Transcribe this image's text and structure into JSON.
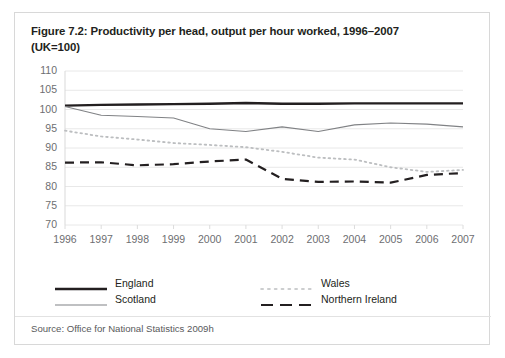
{
  "figure": {
    "title_line1": "Figure 7.2: Productivity per head, output per hour worked, 1996–2007",
    "title_line2": "(UK=100)",
    "source": "Source: Office for National Statistics 2009h"
  },
  "legend": {
    "items": [
      {
        "label": "England",
        "style": "thick-solid",
        "color": "#231f20"
      },
      {
        "label": "Scotland",
        "style": "thin-solid",
        "color": "#808285"
      },
      {
        "label": "Wales",
        "style": "dotted",
        "color": "#bcbec0"
      },
      {
        "label": "Northern Ireland",
        "style": "dashed",
        "color": "#231f20"
      }
    ]
  },
  "chart_data": {
    "type": "line",
    "title": "Figure 7.2: Productivity per head, output per hour worked, 1996–2007 (UK=100)",
    "xlabel": "",
    "ylabel": "",
    "categories": [
      "1996",
      "1997",
      "1998",
      "1999",
      "2000",
      "2001",
      "2002",
      "2003",
      "2004",
      "2005",
      "2006",
      "2007"
    ],
    "x": [
      1996,
      1997,
      1998,
      1999,
      2000,
      2001,
      2002,
      2003,
      2004,
      2005,
      2006,
      2007
    ],
    "ylim": [
      70,
      110
    ],
    "yticks": [
      70,
      75,
      80,
      85,
      90,
      95,
      100,
      105,
      110
    ],
    "grid": true,
    "legend_position": "bottom",
    "series": [
      {
        "name": "England",
        "style": "thick-solid",
        "color": "#231f20",
        "values": [
          101.0,
          101.2,
          101.3,
          101.4,
          101.5,
          101.7,
          101.5,
          101.5,
          101.6,
          101.6,
          101.6,
          101.6
        ]
      },
      {
        "name": "Scotland",
        "style": "thin-solid",
        "color": "#808285",
        "values": [
          100.8,
          98.5,
          98.2,
          97.8,
          95.0,
          94.3,
          95.5,
          94.3,
          96.0,
          96.5,
          96.2,
          95.5
        ]
      },
      {
        "name": "Wales",
        "style": "dotted",
        "color": "#bcbec0",
        "values": [
          94.5,
          93.0,
          92.2,
          91.3,
          90.8,
          90.2,
          89.0,
          87.5,
          87.0,
          85.0,
          83.8,
          84.3
        ]
      },
      {
        "name": "Northern Ireland",
        "style": "dashed",
        "color": "#231f20",
        "values": [
          86.2,
          86.3,
          85.5,
          85.8,
          86.5,
          87.0,
          82.0,
          81.2,
          81.3,
          81.0,
          83.0,
          83.5
        ]
      }
    ]
  }
}
